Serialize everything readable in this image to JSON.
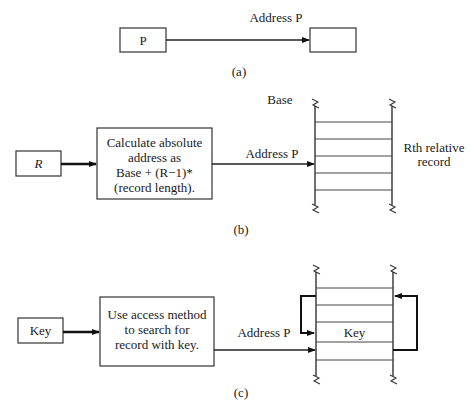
{
  "figure": {
    "panel_a": {
      "caption": "(a)",
      "source_box": "P",
      "arrow_label": "Address P",
      "target_box": ""
    },
    "panel_b": {
      "caption": "(b)",
      "input_box": "R",
      "process_box_lines": [
        "Calculate absolute",
        "address as",
        "Base + (R−1)*",
        "(record length)."
      ],
      "arrow_label": "Address P",
      "storage_top_label": "Base",
      "side_label_lines": [
        "Rth relative",
        "record"
      ],
      "record_slots": 5
    },
    "panel_c": {
      "caption": "(c)",
      "input_box": "Key",
      "process_box_lines": [
        "Use access method",
        "to search for",
        "record with key."
      ],
      "arrow_label": "Address P",
      "highlighted_record": "Key",
      "record_slots": 6
    }
  }
}
